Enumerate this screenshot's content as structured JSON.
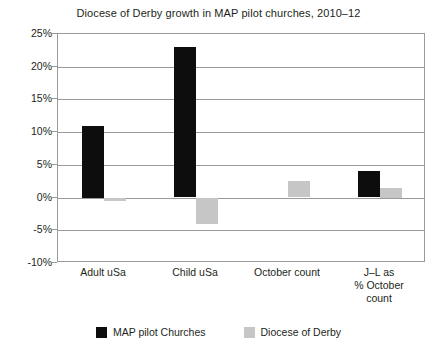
{
  "chart_data": {
    "type": "bar",
    "title": "Diocese of Derby growth in MAP pilot churches, 2010–12",
    "xlabel": "",
    "ylabel": "",
    "categories": [
      "Adult uSa",
      "Child uSa",
      "October count",
      "J–L as % October count"
    ],
    "category_lines": [
      [
        "Adult uSa"
      ],
      [
        "Child uSa"
      ],
      [
        "October count"
      ],
      [
        "J–L as",
        "% October",
        "count"
      ]
    ],
    "series": [
      {
        "name": "MAP pilot Churches",
        "color": "#0d0d0d",
        "values": [
          11,
          23,
          0,
          4
        ]
      },
      {
        "name": "Diocese of Derby",
        "color": "#c6c6c6",
        "values": [
          -0.5,
          -4,
          2.5,
          1.5
        ]
      }
    ],
    "ylim": [
      -10,
      25
    ],
    "ytick_values": [
      25,
      20,
      15,
      10,
      5,
      0,
      -5,
      -10
    ],
    "ytick_labels": [
      "25%",
      "20%",
      "15%",
      "10%",
      "5%",
      "0%",
      "-5%",
      "-10%"
    ],
    "grid": true,
    "legend_position": "bottom",
    "units": "percent"
  },
  "legend": {
    "items": [
      {
        "label": "MAP pilot Churches"
      },
      {
        "label": "Diocese of Derby"
      }
    ]
  },
  "colors": {
    "series_black": "#0d0d0d",
    "series_grey": "#c6c6c6",
    "axis": "#9a9a9a",
    "text": "#231f20",
    "background": "#ffffff"
  }
}
